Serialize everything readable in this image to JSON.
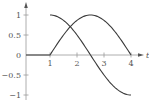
{
  "chart_data": {
    "type": "line",
    "title": "",
    "xlabel": "t",
    "ylabel": "",
    "xlim": [
      0,
      4.3
    ],
    "ylim": [
      -1.1,
      1.1
    ],
    "grid": false,
    "legend": null,
    "x_ticks": [
      1,
      2,
      3,
      4
    ],
    "x_tick_labels": [
      "1",
      "2",
      "3",
      "4"
    ],
    "y_ticks": [
      1,
      0.5,
      0,
      -0.5,
      -1
    ],
    "y_tick_labels": [
      "1",
      "0.5",
      "0",
      "−0.5",
      "−1"
    ],
    "series": [
      {
        "name": "curve-a-cosine",
        "description": "cos(pi*(t-1)/3) for 1 <= t <= 4",
        "x": [
          1,
          1.25,
          1.5,
          1.75,
          2,
          2.25,
          2.5,
          2.75,
          3,
          3.25,
          3.5,
          3.75,
          4
        ],
        "values": [
          1,
          0.966,
          0.866,
          0.707,
          0.5,
          0.259,
          0,
          -0.259,
          -0.5,
          -0.707,
          -0.866,
          -0.966,
          -1
        ]
      },
      {
        "name": "curve-b-sine",
        "description": "0 for 0 <= t <= 1, sin(pi*(t-1)/3) for 1 <= t <= 4",
        "x": [
          0,
          1,
          1.25,
          1.5,
          1.75,
          2,
          2.25,
          2.5,
          2.75,
          3,
          3.25,
          3.5,
          3.75,
          4
        ],
        "values": [
          0,
          0,
          0.259,
          0.5,
          0.707,
          0.866,
          0.966,
          1,
          0.966,
          0.866,
          0.707,
          0.5,
          0.259,
          0
        ]
      }
    ]
  },
  "labels": {
    "x_axis": "t",
    "x1": "1",
    "x2": "2",
    "x3": "3",
    "x4": "4",
    "y1": "1",
    "y05": "0.5",
    "y0": "0",
    "yn05": "−0.5",
    "yn1": "−1"
  }
}
